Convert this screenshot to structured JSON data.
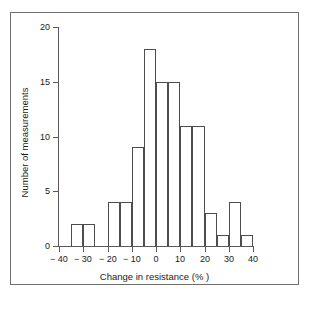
{
  "chart_data": {
    "type": "bar",
    "title": "",
    "subtitle": "",
    "xlabel": "Change in resistance (% )",
    "ylabel": "Number of measurements",
    "xlim": [
      -40,
      40
    ],
    "ylim": [
      0,
      20
    ],
    "grid": false,
    "legend": null,
    "bin_width": 5,
    "x_tick_labels": [
      "− 40",
      "− 30",
      "− 20",
      "− 10",
      "0",
      "10",
      "20",
      "30",
      "40"
    ],
    "x_tick_values": [
      -40,
      -30,
      -20,
      -10,
      0,
      10,
      20,
      30,
      40
    ],
    "y_tick_labels": [
      "0",
      "5",
      "10",
      "15",
      "20"
    ],
    "y_tick_values": [
      0,
      5,
      10,
      15,
      20
    ],
    "bin_starts": [
      -40,
      -35,
      -30,
      -25,
      -20,
      -15,
      -10,
      -5,
      0,
      5,
      10,
      15,
      20,
      25,
      30,
      35
    ],
    "bin_ends": [
      -35,
      -30,
      -25,
      -20,
      -15,
      -10,
      -5,
      0,
      5,
      10,
      15,
      20,
      25,
      30,
      35,
      40
    ],
    "categories": [
      "-40 to -35",
      "-35 to -30",
      "-30 to -25",
      "-25 to -20",
      "-20 to -15",
      "-15 to -10",
      "-10 to -5",
      "-5 to 0",
      "0 to 5",
      "5 to 10",
      "10 to 15",
      "15 to 20",
      "20 to 25",
      "25 to 30",
      "30 to 35",
      "35 to 40"
    ],
    "values": [
      0,
      2,
      2,
      0,
      4,
      4,
      9,
      18,
      15,
      15,
      11,
      11,
      3,
      1,
      4,
      1
    ]
  },
  "axes": {
    "x_axis_name": "Change in resistance (% )",
    "y_axis_name": "Number of measurements"
  }
}
